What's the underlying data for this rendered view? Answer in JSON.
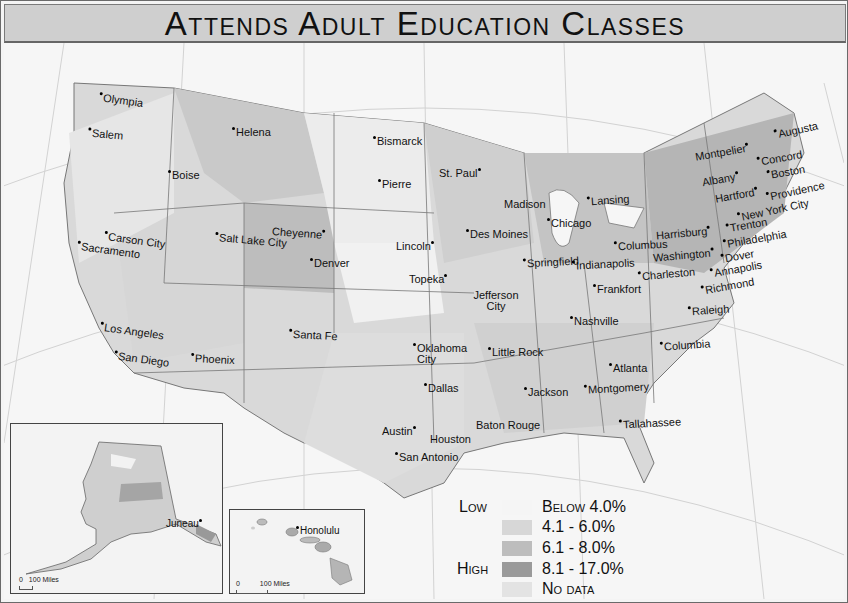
{
  "title": "Attends Adult Education Classes",
  "colors": {
    "below_4": "#f5f5f5",
    "4_1_to_6_0": "#d7d7d7",
    "6_1_to_8_0": "#bdbdbd",
    "8_1_to_17_0": "#9a9a9a",
    "no_data": "#e3e3e3",
    "state_border": "#777777",
    "graticule": "#d2d2d2"
  },
  "legend": {
    "low_label": "Low",
    "high_label": "High",
    "items": [
      {
        "label": "Below 4.0%",
        "color": "#f5f5f5"
      },
      {
        "label": "4.1 - 6.0%",
        "color": "#d7d7d7"
      },
      {
        "label": "6.1 - 8.0%",
        "color": "#bdbdbd"
      },
      {
        "label": "8.1 - 17.0%",
        "color": "#9a9a9a"
      },
      {
        "label": "No data",
        "color": "#e3e3e3"
      }
    ]
  },
  "scale_bars": {
    "main": {
      "zero": "0",
      "distance": "100",
      "unit": "Miles"
    },
    "alaska": {
      "zero": "0",
      "distance": "100",
      "unit": "Miles"
    },
    "hawaii": {
      "zero": "0",
      "distance": "100",
      "unit": "Miles"
    }
  },
  "insets": {
    "alaska": {
      "city": "Juneau"
    },
    "hawaii": {
      "city": "Honolulu"
    }
  },
  "cities": [
    {
      "name": "Olympia"
    },
    {
      "name": "Salem"
    },
    {
      "name": "Helena"
    },
    {
      "name": "Boise"
    },
    {
      "name": "Bismarck"
    },
    {
      "name": "Pierre"
    },
    {
      "name": "St. Paul"
    },
    {
      "name": "Madison"
    },
    {
      "name": "Lansing"
    },
    {
      "name": "Chicago"
    },
    {
      "name": "Des Moines"
    },
    {
      "name": "Lincoln"
    },
    {
      "name": "Cheyenne"
    },
    {
      "name": "Salt Lake City"
    },
    {
      "name": "Carson City"
    },
    {
      "name": "Sacramento"
    },
    {
      "name": "Denver"
    },
    {
      "name": "Topeka"
    },
    {
      "name": "Jefferson City"
    },
    {
      "name": "Springfield"
    },
    {
      "name": "Indianapolis"
    },
    {
      "name": "Columbus"
    },
    {
      "name": "Frankfort"
    },
    {
      "name": "Charleston"
    },
    {
      "name": "Harrisburg"
    },
    {
      "name": "Washington"
    },
    {
      "name": "Annapolis"
    },
    {
      "name": "Dover"
    },
    {
      "name": "Richmond"
    },
    {
      "name": "Philadelphia"
    },
    {
      "name": "Trenton"
    },
    {
      "name": "New York City"
    },
    {
      "name": "Hartford"
    },
    {
      "name": "Providence"
    },
    {
      "name": "Albany"
    },
    {
      "name": "Boston"
    },
    {
      "name": "Montpelier"
    },
    {
      "name": "Concord"
    },
    {
      "name": "Augusta"
    },
    {
      "name": "Los Angeles"
    },
    {
      "name": "San Diego"
    },
    {
      "name": "Phoenix"
    },
    {
      "name": "Santa Fe"
    },
    {
      "name": "Oklahoma City"
    },
    {
      "name": "Dallas"
    },
    {
      "name": "Austin"
    },
    {
      "name": "San Antonio"
    },
    {
      "name": "Houston"
    },
    {
      "name": "Little Rock"
    },
    {
      "name": "Nashville"
    },
    {
      "name": "Raleigh"
    },
    {
      "name": "Columbia"
    },
    {
      "name": "Atlanta"
    },
    {
      "name": "Montgomery"
    },
    {
      "name": "Jackson"
    },
    {
      "name": "Baton Rouge"
    },
    {
      "name": "Tallahassee"
    }
  ]
}
